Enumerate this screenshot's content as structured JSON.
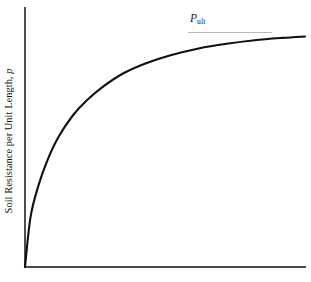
{
  "figure": {
    "background_color": "#ffffff",
    "axis_color": "#4d4d4d",
    "curve_color": "#101010",
    "asymptote_color": "#b9b9b9"
  },
  "annotations": {
    "pult_symbol": "P",
    "pult_subscript": "ult"
  },
  "chart_data": {
    "type": "line",
    "title": "",
    "subtitle": "",
    "xlabel": "",
    "ylabel_parts": {
      "main": "Soil Resistance per Unit Length, ",
      "variable": "p"
    },
    "ylabel": "Soil Resistance per Unit Length, p",
    "grid": false,
    "legend": null,
    "xlim": [
      0,
      1
    ],
    "ylim": [
      0,
      1.05
    ],
    "xticks": [],
    "yticks": [],
    "xticklabels": [],
    "yticklabels": [],
    "series": [
      {
        "name": "p-y curve",
        "description": "hyperbolic soil resistance curve approaching ultimate resistance",
        "x": [
          0.0,
          0.02,
          0.05,
          0.08,
          0.12,
          0.17,
          0.22,
          0.28,
          0.35,
          0.43,
          0.52,
          0.62,
          0.72,
          0.82,
          0.92,
          1.0
        ],
        "y": [
          0.0,
          0.215,
          0.355,
          0.455,
          0.555,
          0.645,
          0.71,
          0.77,
          0.825,
          0.868,
          0.903,
          0.932,
          0.952,
          0.967,
          0.977,
          0.983
        ]
      }
    ],
    "annotations": [
      {
        "name": "ultimate-resistance-asymptote",
        "label": "P_ult",
        "type": "horizontal-line",
        "y": 1.0,
        "x_start": 0.58,
        "x_end": 0.88
      }
    ]
  }
}
